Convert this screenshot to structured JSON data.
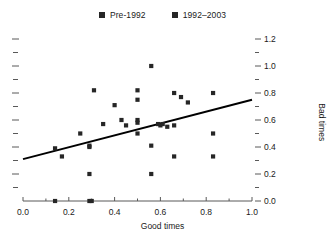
{
  "chart_data": {
    "type": "scatter",
    "title": "",
    "xlabel": "Good times",
    "ylabel": "Bad times",
    "xlim": [
      0.0,
      1.0
    ],
    "ylim": [
      0.0,
      1.2
    ],
    "grid": false,
    "legend_position": "top-center",
    "x_ticks": [
      "0.0",
      "0.2",
      "0.4",
      "0.6",
      "0.8",
      "1.0"
    ],
    "x_tick_values": [
      0.0,
      0.2,
      0.4,
      0.6,
      0.8,
      1.0
    ],
    "x_minor_tick_values": [
      0.1,
      0.3,
      0.5,
      0.7,
      0.9
    ],
    "y_ticks": [
      "0.0",
      "0.2",
      "0.4",
      "0.6",
      "0.8",
      "1.0",
      "1.2"
    ],
    "y_tick_values": [
      0.0,
      0.2,
      0.4,
      0.6,
      0.8,
      1.0,
      1.2
    ],
    "y_minor_tick_values": [
      0.1,
      0.3,
      0.5,
      0.7,
      0.9,
      1.1
    ],
    "marker_color": "#262626",
    "line_color": "#000000",
    "axis_color": "#595959",
    "series": [
      {
        "name": "Pre-1992",
        "marker": "square",
        "color": "#262626",
        "points": [
          [
            0.14,
            0.39
          ],
          [
            0.17,
            0.33
          ],
          [
            0.25,
            0.5
          ],
          [
            0.29,
            0.41
          ],
          [
            0.29,
            0.4
          ],
          [
            0.29,
            0.2
          ],
          [
            0.29,
            0.0
          ],
          [
            0.3,
            0.0
          ],
          [
            0.14,
            0.0
          ],
          [
            0.35,
            0.57
          ],
          [
            0.31,
            0.82
          ],
          [
            0.4,
            0.71
          ],
          [
            0.43,
            0.6
          ],
          [
            0.45,
            0.56
          ]
        ]
      },
      {
        "name": "1992–2003",
        "marker": "square",
        "color": "#262626",
        "points": [
          [
            0.5,
            0.82
          ],
          [
            0.5,
            0.75
          ],
          [
            0.5,
            0.6
          ],
          [
            0.5,
            0.58
          ],
          [
            0.5,
            0.5
          ],
          [
            0.56,
            1.0
          ],
          [
            0.56,
            0.41
          ],
          [
            0.56,
            0.2
          ],
          [
            0.59,
            0.57
          ],
          [
            0.6,
            0.56
          ],
          [
            0.61,
            0.57
          ],
          [
            0.63,
            0.55
          ],
          [
            0.66,
            0.8
          ],
          [
            0.66,
            0.56
          ],
          [
            0.66,
            0.33
          ],
          [
            0.69,
            0.77
          ],
          [
            0.72,
            0.73
          ],
          [
            0.83,
            0.8
          ],
          [
            0.83,
            0.5
          ],
          [
            0.83,
            0.33
          ]
        ]
      }
    ],
    "trendline": {
      "x0": 0.0,
      "y0": 0.31,
      "x1": 1.0,
      "y1": 0.75,
      "color": "#000000",
      "width": 2
    }
  },
  "legend": {
    "entries": [
      {
        "label": "Pre-1992",
        "color": "#262626"
      },
      {
        "label": "1992–2003",
        "color": "#262626"
      }
    ]
  },
  "axes": {
    "x_title": "Good times",
    "y_title": "Bad times"
  }
}
